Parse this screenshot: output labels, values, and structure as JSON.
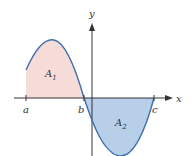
{
  "diagram": {
    "axes": {
      "x_label": "x",
      "y_label": "y"
    },
    "points": {
      "a": "a",
      "b": "b",
      "c": "c"
    },
    "regions": {
      "A1": {
        "label": "A",
        "subscript": "1",
        "color": "#f6dcd8"
      },
      "A2": {
        "label": "A",
        "subscript": "2",
        "color": "#b7cfe8"
      }
    },
    "curve_color": "#3f6fad",
    "axis_color": "#333333"
  }
}
